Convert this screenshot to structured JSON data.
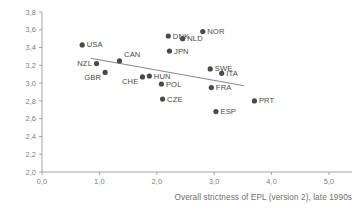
{
  "chart_data": {
    "type": "scatter",
    "title": "",
    "subtitle": "",
    "xlabel": "Overall strictness of EPL (version 2), late 1990s",
    "ylabel": "",
    "xlim": [
      0.0,
      5.4
    ],
    "ylim": [
      2.0,
      3.8
    ],
    "grid": false,
    "legend": "none",
    "xticks": [
      "0,0",
      "1,0",
      "2,0",
      "3,0",
      "4,0",
      "5,0"
    ],
    "xtick_values": [
      0.0,
      1.0,
      2.0,
      3.0,
      4.0,
      5.0
    ],
    "yticks": [
      "2,0",
      "2,2",
      "2,4",
      "2,6",
      "2,8",
      "3,0",
      "3,2",
      "3,4",
      "3,6",
      "3,8"
    ],
    "ytick_values": [
      2.0,
      2.2,
      2.4,
      2.6,
      2.8,
      3.0,
      3.2,
      3.4,
      3.6,
      3.8
    ],
    "points": [
      {
        "label": "USA",
        "x": 0.7,
        "y": 3.43,
        "label_pos": "right"
      },
      {
        "label": "NZL",
        "x": 0.95,
        "y": 3.22,
        "label_pos": "left"
      },
      {
        "label": "GBR",
        "x": 1.1,
        "y": 3.12,
        "label_pos": "left-below"
      },
      {
        "label": "CAN",
        "x": 1.35,
        "y": 3.25,
        "label_pos": "right-above"
      },
      {
        "label": "CHE",
        "x": 1.75,
        "y": 3.07,
        "label_pos": "left-below"
      },
      {
        "label": "HUN",
        "x": 1.87,
        "y": 3.08,
        "label_pos": "right"
      },
      {
        "label": "DNK",
        "x": 2.2,
        "y": 3.53,
        "label_pos": "right"
      },
      {
        "label": "NLD",
        "x": 2.45,
        "y": 3.5,
        "label_pos": "right"
      },
      {
        "label": "NOR",
        "x": 2.8,
        "y": 3.58,
        "label_pos": "right"
      },
      {
        "label": "JPN",
        "x": 2.22,
        "y": 3.36,
        "label_pos": "right"
      },
      {
        "label": "POL",
        "x": 2.08,
        "y": 2.99,
        "label_pos": "right"
      },
      {
        "label": "CZE",
        "x": 2.1,
        "y": 2.82,
        "label_pos": "right"
      },
      {
        "label": "SWE",
        "x": 2.93,
        "y": 3.16,
        "label_pos": "right"
      },
      {
        "label": "ITA",
        "x": 3.13,
        "y": 3.11,
        "label_pos": "right"
      },
      {
        "label": "FRA",
        "x": 2.95,
        "y": 2.95,
        "label_pos": "right"
      },
      {
        "label": "ESP",
        "x": 3.03,
        "y": 2.68,
        "label_pos": "right"
      },
      {
        "label": "PRT",
        "x": 3.7,
        "y": 2.8,
        "label_pos": "right"
      }
    ],
    "trendline": {
      "x0": 0.85,
      "y0": 3.28,
      "x1": 3.52,
      "y1": 2.97
    }
  },
  "colors": {
    "marker": "#4a4a4a",
    "trendline": "#8a8a8a",
    "axis": "#9a9a9a",
    "tick_text": "#7d7d7d",
    "point_text": "#4a4a4a",
    "axis_title_text": "#6f6f6f",
    "background": "#ffffff"
  }
}
